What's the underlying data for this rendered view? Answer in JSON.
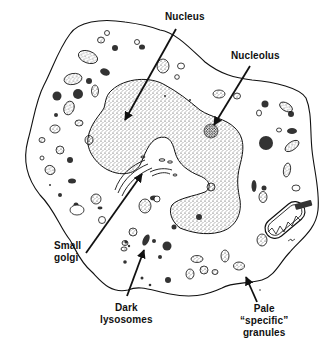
{
  "figure": {
    "colors": {
      "ink": "#111111",
      "background": "#ffffff",
      "stipple": "#222222"
    }
  },
  "labels": {
    "nucleus": {
      "lines": [
        "Nucleus"
      ]
    },
    "nucleolus": {
      "lines": [
        "Nucleolus"
      ]
    },
    "small_golgi": {
      "lines": [
        "Small",
        "golgi"
      ]
    },
    "dark_lysosomes": {
      "lines": [
        "Dark",
        "lysosomes"
      ]
    },
    "pale_granules": {
      "lines": [
        "Pale",
        "“specific”",
        "granules"
      ]
    }
  }
}
